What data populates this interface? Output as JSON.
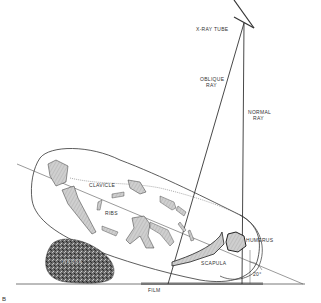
{
  "diagram": {
    "type": "radiographic positioning diagram",
    "labels": {
      "xray_tube": "X-RAY TUBE",
      "oblique_ray_1": "OBLIQUE",
      "oblique_ray_2": "RAY",
      "normal_ray_1": "NORMAL",
      "normal_ray_2": "RAY",
      "clavicle": "CLAVICLE",
      "ribs": "RIBS",
      "humerus": "HUMERUS",
      "scapula": "SCAPULA",
      "angle": "20°",
      "film": "FILM",
      "wedge": "WEDGE",
      "figure_mark": "B"
    },
    "colors": {
      "line": "#333333",
      "bone_fill": "#c8c8c8",
      "wedge_fill": "#6a6a6a",
      "background": "#ffffff"
    }
  }
}
